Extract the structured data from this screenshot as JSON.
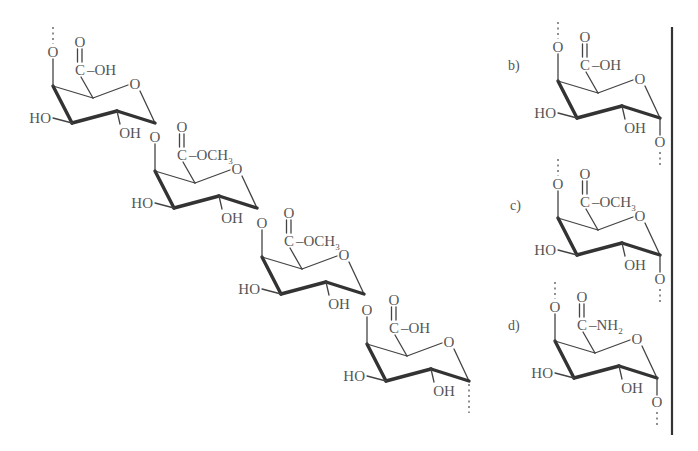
{
  "figure": {
    "colors": {
      "text": "#555555",
      "bond": "#444444",
      "divider": "#333333",
      "background": "#ffffff"
    },
    "chain": {
      "residues": [
        {
          "offset": [
            0,
            0
          ],
          "substituent": "C-OH",
          "sub_text": "C–OH",
          "subscript": ""
        },
        {
          "offset": [
            102,
            85
          ],
          "substituent": "C-OCH3",
          "sub_text": "C–OCH",
          "subscript": "3"
        },
        {
          "offset": [
            209,
            171
          ],
          "substituent": "C-OCH3",
          "sub_text": "C–OCH",
          "subscript": "3"
        },
        {
          "offset": [
            314,
            258
          ],
          "substituent": "C-OH",
          "sub_text": "C–OH",
          "subscript": ""
        }
      ]
    },
    "panels": [
      {
        "label": "b)",
        "label_pos": [
          508,
          70
        ],
        "origin": [
          505,
          -5
        ],
        "sub_text": "C–OH",
        "subscript": ""
      },
      {
        "label": "c)",
        "label_pos": [
          510,
          210
        ],
        "origin": [
          505,
          132
        ],
        "sub_text": "C–OCH",
        "subscript": "3"
      },
      {
        "label": "d)",
        "label_pos": [
          508,
          330
        ],
        "origin": [
          502,
          255
        ],
        "sub_text": "C–NH",
        "subscript": "2"
      }
    ],
    "atoms": {
      "ring_oxygen": "O",
      "carbonyl_oxygen": "O",
      "linkage_oxygen": "O",
      "hydroxyl_left": "HO",
      "hydroxyl_right": "OH"
    },
    "divider": {
      "x": 672,
      "y1": 27,
      "y2": 435
    }
  }
}
